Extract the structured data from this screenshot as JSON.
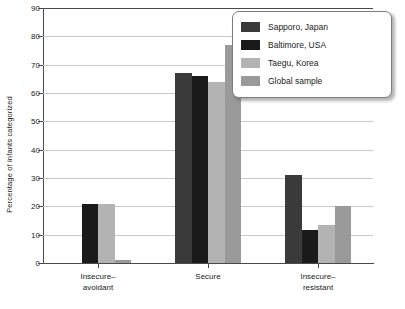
{
  "chart_data": {
    "type": "bar",
    "title": "",
    "xlabel": "",
    "ylabel": "Percentage of infants categorized",
    "ylim": [
      0,
      90
    ],
    "ytick_step": 10,
    "yticks": [
      0,
      10,
      20,
      30,
      40,
      50,
      60,
      70,
      80,
      90
    ],
    "grid": true,
    "legend_position": "top-right",
    "categories": [
      "Insecure–\navoidant",
      "Secure",
      "Insecure–\nresistant"
    ],
    "series": [
      {
        "name": "Sapporo, Japan",
        "color": "#3a3a3a",
        "values": [
          0,
          67,
          31
        ]
      },
      {
        "name": "Baltimore, USA",
        "color": "#1a1a1a",
        "values": [
          21,
          66,
          11.5
        ]
      },
      {
        "name": "Taegu, Korea",
        "color": "#b3b3b3",
        "values": [
          21,
          64,
          13.5
        ]
      },
      {
        "name": "Global sample",
        "color": "#9a9a9a",
        "values": [
          1,
          77,
          20
        ]
      }
    ]
  },
  "legend": {
    "items": [
      {
        "label": "Sapporo, Japan"
      },
      {
        "label": "Baltimore, USA"
      },
      {
        "label": "Taegu, Korea"
      },
      {
        "label": "Global sample"
      }
    ]
  },
  "axes": {
    "y_title": "Percentage of infants categorized"
  }
}
